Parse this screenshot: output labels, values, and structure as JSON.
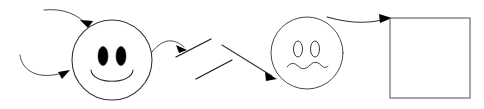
{
  "canvas": {
    "width": 484,
    "height": 109,
    "background": "#ffffff",
    "title": "hand-drawn sketch diagram"
  },
  "palette": {
    "ink_light": "#4a4a4a",
    "ink_mid": "#333333",
    "ink_dark": "#1a1a1a",
    "eye_fill": "#000000",
    "box_stroke": "#6b6b6b",
    "background": "#ffffff"
  },
  "shapes": {
    "smiley_face": {
      "label": "smiley face",
      "cx": 112,
      "cy": 60,
      "r": 40,
      "eyes": "filled-oval",
      "mouth": "wide-smile"
    },
    "worried_face": {
      "label": "worried face",
      "cx": 307,
      "cy": 53,
      "r": 36,
      "eyes": "outline-oval",
      "mouth": "wavy-squiggle"
    },
    "rectangle": {
      "label": "empty rectangle",
      "x": 390,
      "y": 18,
      "width": 80,
      "height": 80
    },
    "parallel_strokes": {
      "label": "two parallel diagonal strokes",
      "count": 2
    }
  },
  "connectors": {
    "top_left_arrow": {
      "label": "curved arrow into top of smiley face",
      "style": "curved",
      "arrowhead": true
    },
    "bottom_left_arrow": {
      "label": "curved arrow into left of smiley face",
      "style": "curved",
      "arrowhead": true
    },
    "smiley_to_strokes_arrow": {
      "label": "curved arrow from smiley face to parallel strokes",
      "style": "curved",
      "arrowhead": true
    },
    "strokes_to_worried_arrow": {
      "label": "straight diagonal arrow into worried face",
      "style": "straight",
      "arrowhead": true
    },
    "worried_to_box_arrow": {
      "label": "curved arrow from worried face to rectangle",
      "style": "curved",
      "arrowhead": true
    }
  }
}
